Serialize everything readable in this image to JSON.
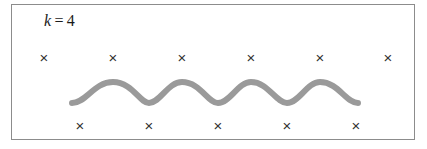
{
  "figure": {
    "background_color": "#ffffff",
    "frame": {
      "border_color": "#8c8c8c",
      "border_width_px": 1,
      "x": 11,
      "y": 4,
      "width": 404,
      "height": 136
    },
    "label": {
      "symbol": "k",
      "equals": "=",
      "value": "4",
      "full_text": "k = 4",
      "color": "#1b1b1b"
    }
  },
  "chart_data": {
    "type": "scatter",
    "subtitle": "",
    "xlabel": "",
    "ylabel": "",
    "grid": false,
    "legend_position": "none",
    "axis_visible": false,
    "xlim": [
      0,
      427
    ],
    "ylim": [
      0,
      149
    ],
    "annotations": [
      {
        "text": "k = 4",
        "x": 45,
        "y": 24
      }
    ],
    "series": [
      {
        "name": "top-markers",
        "type": "scatter",
        "marker": "x",
        "marker_color": "#333333",
        "marker_size_px": 15,
        "count": 6,
        "x": [
          44,
          113,
          182,
          251,
          320,
          388
        ],
        "y": [
          58,
          58,
          58,
          58,
          58,
          58
        ]
      },
      {
        "name": "bottom-markers",
        "type": "scatter",
        "marker": "x",
        "marker_color": "#333333",
        "marker_size_px": 15,
        "count": 5,
        "x": [
          80,
          149,
          218,
          287,
          356
        ],
        "y": [
          126,
          126,
          126,
          126,
          126
        ]
      },
      {
        "name": "wave",
        "type": "line",
        "line_color": "#9a9a9a",
        "line_width_px": 6,
        "periods": 4,
        "x_start": 72,
        "x_end": 358,
        "wavelength_px": 69,
        "amplitude_px": 11,
        "baseline_y": 92,
        "peak_y": 82,
        "trough_y": 103,
        "path": "M 72,103 C 86,103 94,82 113,82 C 132,82 140,103 149,103 C 160,103 168,82 182,82 C 200,82 208,103 218,103 C 230,103 238,82 251,82 C 268,82 276,103 287,103 C 299,103 307,82 320,82 C 338,82 346,103 358,103"
      }
    ]
  },
  "markers": {
    "glyph": "×",
    "top_label": "x-marker",
    "bottom_label": "x-marker"
  }
}
